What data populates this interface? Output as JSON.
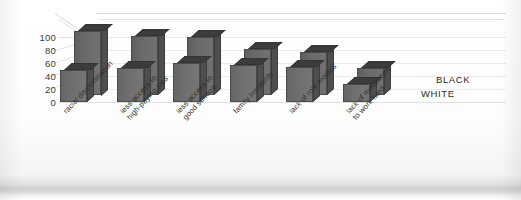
{
  "chart_data": {
    "type": "bar",
    "title": "",
    "subtitle": "",
    "xlabel": "",
    "ylabel": "",
    "ylim": [
      0,
      100
    ],
    "yticks": [
      0,
      20,
      40,
      60,
      80,
      100
    ],
    "grid": true,
    "legend_position": "right",
    "style": "3d-grouped-bars",
    "categories": [
      "racial discrimination",
      "less access to\nhigh-paying jobs",
      "less access to\ngood schools",
      "family instability",
      "lack of role models",
      "lack of motivation\nto work hard"
    ],
    "series": [
      {
        "name": "BLACK",
        "values": [
          100,
          92,
          90,
          72,
          66,
          42
        ]
      },
      {
        "name": "WHITE",
        "values": [
          50,
          52,
          60,
          58,
          54,
          28
        ]
      }
    ]
  },
  "yaxis": {
    "labels": [
      "100",
      "80",
      "60",
      "40",
      "20",
      "0"
    ]
  },
  "legend": {
    "items": [
      {
        "label": "BLACK"
      },
      {
        "label": "WHITE"
      }
    ]
  }
}
